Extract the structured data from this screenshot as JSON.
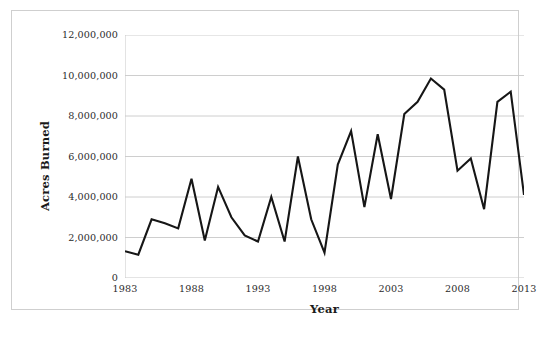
{
  "chart_data": {
    "type": "line",
    "title": "",
    "xlabel": "Year",
    "ylabel": "Acres Burned",
    "xlim": [
      1983,
      2013
    ],
    "ylim": [
      0,
      12000000
    ],
    "grid": true,
    "legend": false,
    "x_tick_labels": [
      "1983",
      "1988",
      "1993",
      "1998",
      "2003",
      "2008",
      "2013"
    ],
    "x_tick_values": [
      1983,
      1988,
      1993,
      1998,
      2003,
      2008,
      2013
    ],
    "x_minor_tick_step": 1,
    "y_tick_labels": [
      "0",
      "2,000,000",
      "4,000,000",
      "6,000,000",
      "8,000,000",
      "10,000,000",
      "12,000,000"
    ],
    "y_tick_values": [
      0,
      2000000,
      4000000,
      6000000,
      8000000,
      10000000,
      12000000
    ],
    "line_color": "#161616",
    "grid_color": "#c8c8c8",
    "x": [
      1983,
      1984,
      1985,
      1986,
      1987,
      1988,
      1989,
      1990,
      1991,
      1992,
      1993,
      1994,
      1995,
      1996,
      1997,
      1998,
      1999,
      2000,
      2001,
      2002,
      2003,
      2004,
      2005,
      2006,
      2007,
      2008,
      2009,
      2010,
      2011,
      2012,
      2013
    ],
    "values": [
      1320000,
      1150000,
      2900000,
      2700000,
      2450000,
      4900000,
      1850000,
      4500000,
      3000000,
      2100000,
      1800000,
      4000000,
      1800000,
      6000000,
      2900000,
      1250000,
      5600000,
      7250000,
      3500000,
      7100000,
      3900000,
      8100000,
      8700000,
      9850000,
      9300000,
      5300000,
      5900000,
      3400000,
      8700000,
      9200000,
      4100000
    ],
    "series_name": "Acres Burned"
  },
  "caption": {
    "text": ""
  }
}
